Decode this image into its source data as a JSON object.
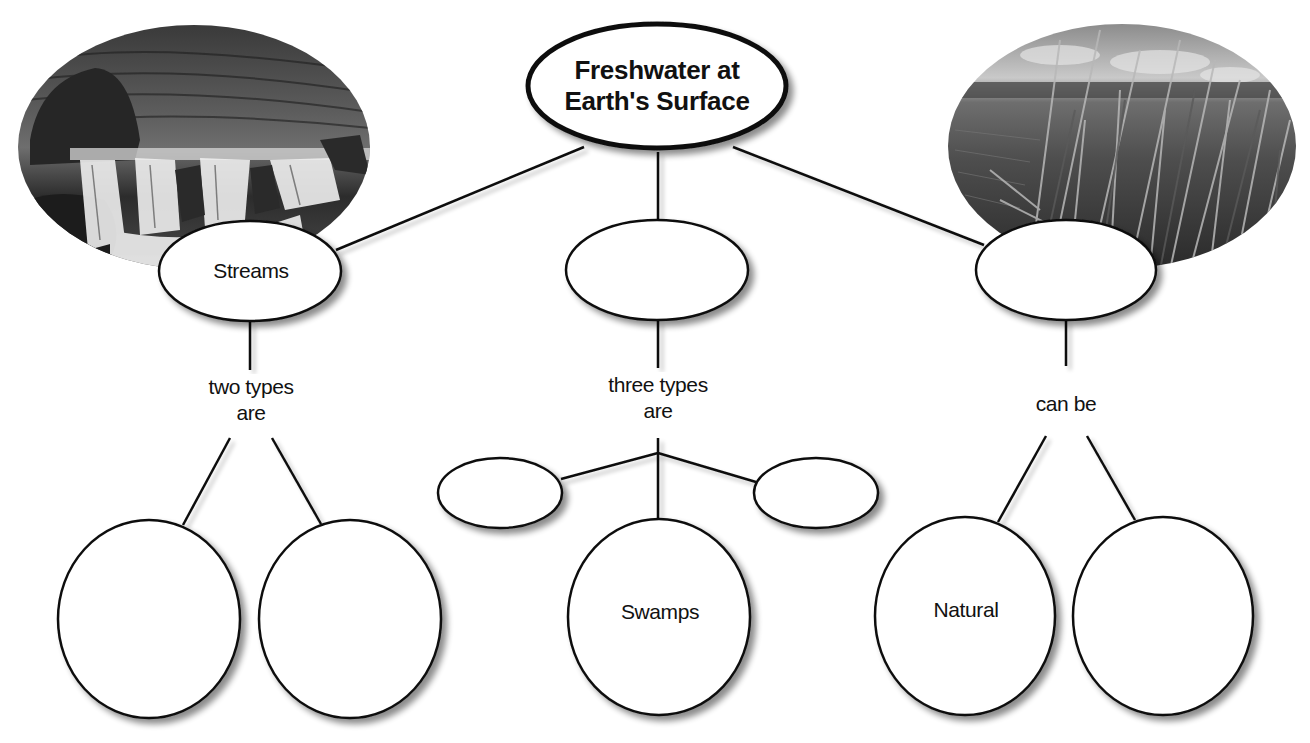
{
  "diagram": {
    "type": "concept-map",
    "colors": {
      "background": "#ffffff",
      "stroke": "#111111",
      "node_fill": "#ffffff",
      "shadow": "#9a9a9a"
    },
    "title": {
      "line1": "Freshwater at",
      "line2": "Earth's Surface"
    },
    "photos": {
      "left": {
        "subject": "waterfall-stream-photo",
        "tone": "grayscale"
      },
      "right": {
        "subject": "wetland-reeds-photo",
        "tone": "grayscale"
      }
    },
    "branches": [
      {
        "id": "left",
        "concept": "Streams",
        "link_label_line1": "two types",
        "link_label_line2": "are",
        "children": [
          "",
          ""
        ]
      },
      {
        "id": "center",
        "concept": "",
        "link_label_line1": "three types",
        "link_label_line2": "are",
        "children": [
          "",
          "Swamps",
          ""
        ]
      },
      {
        "id": "right",
        "concept": "",
        "link_label_line1": "can be",
        "link_label_line2": "",
        "children": [
          "Natural",
          ""
        ]
      }
    ]
  }
}
